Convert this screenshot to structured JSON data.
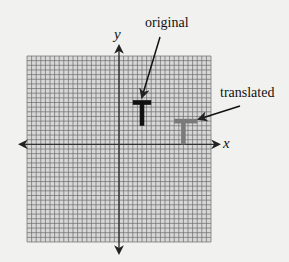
{
  "figure": {
    "axes": {
      "x_label": "x",
      "y_label": "y",
      "grid_cells_x": 40,
      "grid_cells_y": 40,
      "origin_cell": [
        20,
        19
      ]
    },
    "shapes": [
      {
        "name": "original",
        "label": "original",
        "color": "#111111",
        "bar_cells": {
          "x0": 3,
          "x1": 7,
          "y": 9
        },
        "stem_cells": {
          "x": 5,
          "y0": 4,
          "y1": 9
        }
      },
      {
        "name": "translated",
        "label": "translated",
        "color": "#7a7a7a",
        "bar_cells": {
          "x0": 12,
          "x1": 17,
          "y": 5
        },
        "stem_cells": {
          "x": 14,
          "y0": 0,
          "y1": 5
        }
      }
    ],
    "colors": {
      "background": "#f1f1ef",
      "grid_fill": "#d8d8d8",
      "grid_line": "#6a6a6a",
      "axis": "#333333"
    }
  }
}
